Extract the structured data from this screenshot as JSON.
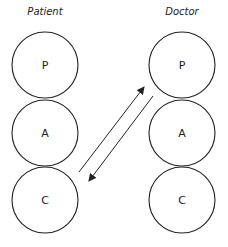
{
  "columns": [
    {
      "heading": "Patient",
      "cx": 45,
      "circles": [
        {
          "label": "P",
          "cy": 65
        },
        {
          "label": "A",
          "cy": 133
        },
        {
          "label": "C",
          "cy": 200
        }
      ]
    },
    {
      "heading": "Doctor",
      "cx": 182,
      "circles": [
        {
          "label": "P",
          "cy": 65
        },
        {
          "label": "A",
          "cy": 133
        },
        {
          "label": "C",
          "cy": 200
        }
      ]
    }
  ],
  "radius": 33,
  "arrows": [
    {
      "from": "Patient C",
      "to": "Doctor P"
    },
    {
      "from": "Doctor P",
      "to": "Patient C"
    }
  ],
  "colors": {
    "stroke": "#222222",
    "background": "#ffffff"
  }
}
